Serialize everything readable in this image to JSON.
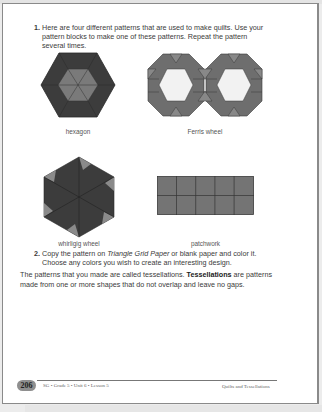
{
  "question1": {
    "number": "1.",
    "text": "Here are four different patterns that are used to make quilts. Use your pattern blocks to make one of these patterns. Repeat the pattern several times."
  },
  "patterns": [
    {
      "name": "hexagon",
      "label": "hexagon"
    },
    {
      "name": "ferris-wheel",
      "label": "Ferris wheel"
    },
    {
      "name": "whirligig-wheel",
      "label": "whirligig wheel"
    },
    {
      "name": "patchwork",
      "label": "patchwork"
    }
  ],
  "question2": {
    "number": "2.",
    "text_before": "Copy the pattern on ",
    "text_italic": "Triangle Grid Paper",
    "text_after": " or blank paper and color it. Choose any colors you wish to create an interesting design."
  },
  "paragraph": {
    "intro": "The patterns that you made are called tessellations. ",
    "term": "Tessellations",
    "rest": " are patterns made from one or more shapes that do not overlap and leave no gaps."
  },
  "footer": {
    "page_number": "206",
    "left_text": "SG • Grade 5 • Unit 6 • Lesson 5",
    "right_text": "Quilts and Tessellations"
  },
  "colors": {
    "dark_gray": "#3c3c3c",
    "mid_gray": "#6e6e6e",
    "light_gray": "#9a9a9a",
    "hex_fill_white": "#f2f2f2"
  }
}
